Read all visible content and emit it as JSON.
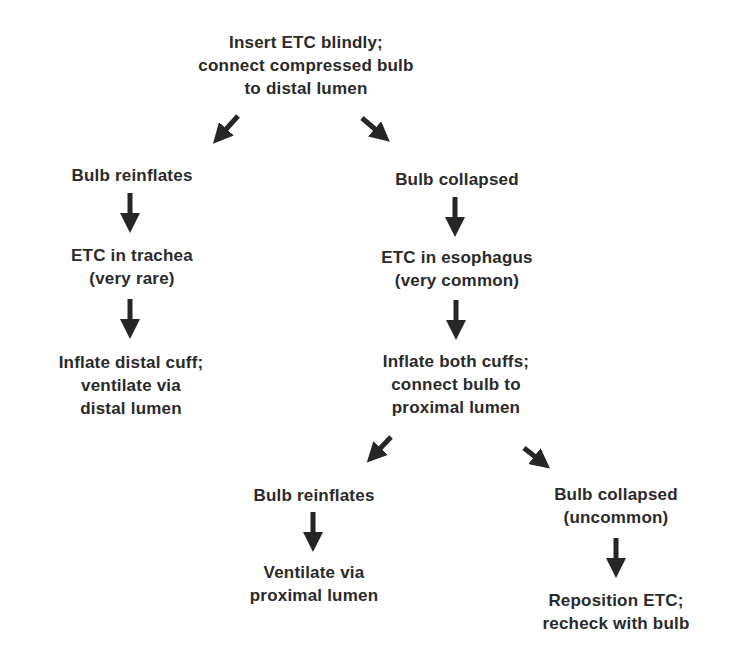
{
  "diagram": {
    "type": "flowchart",
    "colors": {
      "text": "#2a2a2a",
      "arrow": "#262626",
      "background": "#ffffff"
    },
    "nodes": {
      "start": {
        "lines": [
          "Insert ETC blindly;",
          "connect compressed bulb",
          "to distal lumen"
        ]
      },
      "left_bulb_reinflates": {
        "lines": [
          "Bulb reinflates"
        ]
      },
      "etc_trachea": {
        "lines": [
          "ETC in trachea",
          "(very rare)"
        ]
      },
      "inflate_distal": {
        "lines": [
          "Inflate distal cuff;",
          "ventilate via",
          "distal lumen"
        ]
      },
      "right_bulb_collapsed": {
        "lines": [
          "Bulb collapsed"
        ]
      },
      "etc_esophagus": {
        "lines": [
          "ETC in esophagus",
          "(very common)"
        ]
      },
      "inflate_both": {
        "lines": [
          "Inflate both cuffs;",
          "connect bulb to",
          "proximal lumen"
        ]
      },
      "second_bulb_reinflates": {
        "lines": [
          "Bulb reinflates"
        ]
      },
      "ventilate_proximal": {
        "lines": [
          "Ventilate via",
          "proximal lumen"
        ]
      },
      "second_bulb_collapsed": {
        "lines": [
          "Bulb collapsed",
          "(uncommon)"
        ]
      },
      "reposition": {
        "lines": [
          "Reposition ETC;",
          "recheck with bulb"
        ]
      }
    },
    "edges": [
      {
        "from": "start",
        "to": "left_bulb_reinflates",
        "direction": "down-left"
      },
      {
        "from": "start",
        "to": "right_bulb_collapsed",
        "direction": "down-right"
      },
      {
        "from": "left_bulb_reinflates",
        "to": "etc_trachea",
        "direction": "down"
      },
      {
        "from": "etc_trachea",
        "to": "inflate_distal",
        "direction": "down"
      },
      {
        "from": "right_bulb_collapsed",
        "to": "etc_esophagus",
        "direction": "down"
      },
      {
        "from": "etc_esophagus",
        "to": "inflate_both",
        "direction": "down"
      },
      {
        "from": "inflate_both",
        "to": "second_bulb_reinflates",
        "direction": "down-left"
      },
      {
        "from": "inflate_both",
        "to": "second_bulb_collapsed",
        "direction": "down-right"
      },
      {
        "from": "second_bulb_reinflates",
        "to": "ventilate_proximal",
        "direction": "down"
      },
      {
        "from": "second_bulb_collapsed",
        "to": "reposition",
        "direction": "down"
      }
    ]
  }
}
